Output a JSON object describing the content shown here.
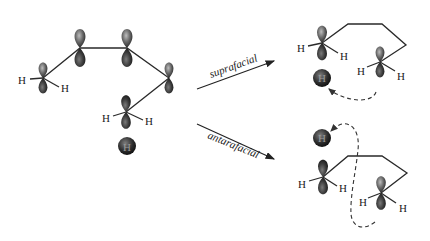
{
  "diagram": {
    "type": "sigmatropic-hydrogen-shift-orbital-diagram",
    "colors": {
      "lobe_dark": "#1c1c1c",
      "lobe_mid": "#6e6e6e",
      "lobe_light": "#a8a8a8",
      "bond": "#2a2a2a",
      "background": "#ffffff"
    },
    "reactant": {
      "atom_labels": [
        "H",
        "H",
        "H",
        "H",
        "H"
      ]
    },
    "arrows": [
      {
        "label": "suprafacial"
      },
      {
        "label": "antarafacial"
      }
    ],
    "products": {
      "suprafacial": {
        "atom_labels": [
          "H",
          "H",
          "H",
          "H",
          "H"
        ]
      },
      "antarafacial": {
        "atom_labels": [
          "H",
          "H",
          "H",
          "H",
          "H"
        ]
      }
    }
  }
}
